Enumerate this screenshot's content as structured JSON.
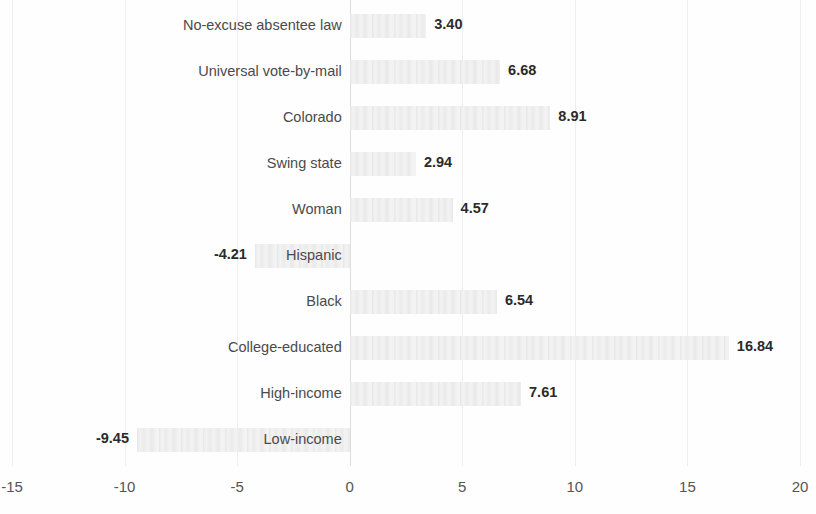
{
  "chart_data": {
    "type": "bar",
    "orientation": "horizontal",
    "title": "",
    "subtitle": "",
    "xlabel": "",
    "ylabel": "",
    "xlim": [
      -15,
      20
    ],
    "xticks": [
      -15,
      -10,
      -5,
      0,
      5,
      10,
      15,
      20
    ],
    "xtick_labels": [
      "-15",
      "-10",
      "-5",
      "0",
      "5",
      "10",
      "15",
      "20"
    ],
    "grid": true,
    "legend": false,
    "legend_position": "none",
    "bar_color": "#f1f1f1",
    "zero_line_color": "#dddddd",
    "gridline_color": "#eeeeee",
    "data_label_color": "#2b2b2b",
    "categories": [
      "No-excuse absentee law",
      "Universal vote-by-mail",
      "Colorado",
      "Swing state",
      "Woman",
      "Hispanic",
      "Black",
      "College-educated",
      "High-income",
      "Low-income"
    ],
    "values": [
      3.4,
      6.68,
      8.91,
      2.94,
      4.57,
      -4.21,
      6.54,
      16.84,
      7.61,
      -9.45
    ],
    "data_labels": [
      "3.40",
      "6.68",
      "8.91",
      "2.94",
      "4.57",
      "-4.21",
      "6.54",
      "16.84",
      "7.61",
      "-9.45"
    ]
  }
}
